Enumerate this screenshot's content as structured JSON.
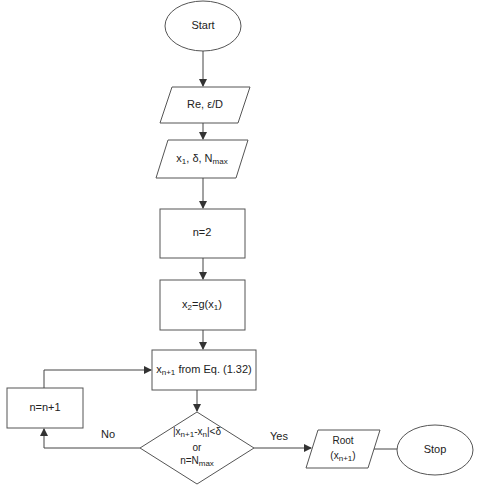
{
  "diagram": {
    "type": "flowchart",
    "nodes": [
      {
        "id": "start",
        "shape": "ellipse",
        "label": "Start"
      },
      {
        "id": "input1",
        "shape": "parallelogram",
        "label": "Re, ε/D"
      },
      {
        "id": "input2",
        "shape": "parallelogram",
        "label_parts": {
          "a": "x",
          "a_sub": "1",
          "b": ", δ, N",
          "b_sub": "max"
        }
      },
      {
        "id": "init_n",
        "shape": "rectangle",
        "label": "n=2"
      },
      {
        "id": "init_x2",
        "shape": "rectangle",
        "label_parts": {
          "a": "x",
          "a_sub": "2",
          "b": "=g(x",
          "b_sub": "1",
          "c": ")"
        }
      },
      {
        "id": "compute",
        "shape": "rectangle",
        "label_parts": {
          "a": "x",
          "a_sub": "n+1",
          "b": " from Eq. (1.32)"
        }
      },
      {
        "id": "increment",
        "shape": "rectangle",
        "label": "n=n+1"
      },
      {
        "id": "decision",
        "shape": "diamond",
        "label_parts": {
          "l1a": "|x",
          "l1a_sub": "n+1",
          "l1b": "-x",
          "l1b_sub": "n",
          "l1c": "|<δ",
          "l2": "or",
          "l3a": "n=N",
          "l3a_sub": "max"
        }
      },
      {
        "id": "output",
        "shape": "parallelogram",
        "label_parts": {
          "l1": "Root",
          "l2a": "(x",
          "l2a_sub": "n+1",
          "l2b": ")"
        }
      },
      {
        "id": "stop",
        "shape": "ellipse",
        "label": "Stop"
      }
    ],
    "edges": [
      {
        "from": "start",
        "to": "input1"
      },
      {
        "from": "input1",
        "to": "input2"
      },
      {
        "from": "input2",
        "to": "init_n"
      },
      {
        "from": "init_n",
        "to": "init_x2"
      },
      {
        "from": "init_x2",
        "to": "compute"
      },
      {
        "from": "compute",
        "to": "decision"
      },
      {
        "from": "decision",
        "to": "increment",
        "label": "No"
      },
      {
        "from": "increment",
        "to": "compute"
      },
      {
        "from": "decision",
        "to": "output",
        "label": "Yes"
      },
      {
        "from": "output",
        "to": "stop"
      }
    ],
    "edge_labels": {
      "no": "No",
      "yes": "Yes"
    }
  },
  "colors": {
    "stroke": "#555555",
    "fill": "#ffffff",
    "text": "#222222"
  }
}
